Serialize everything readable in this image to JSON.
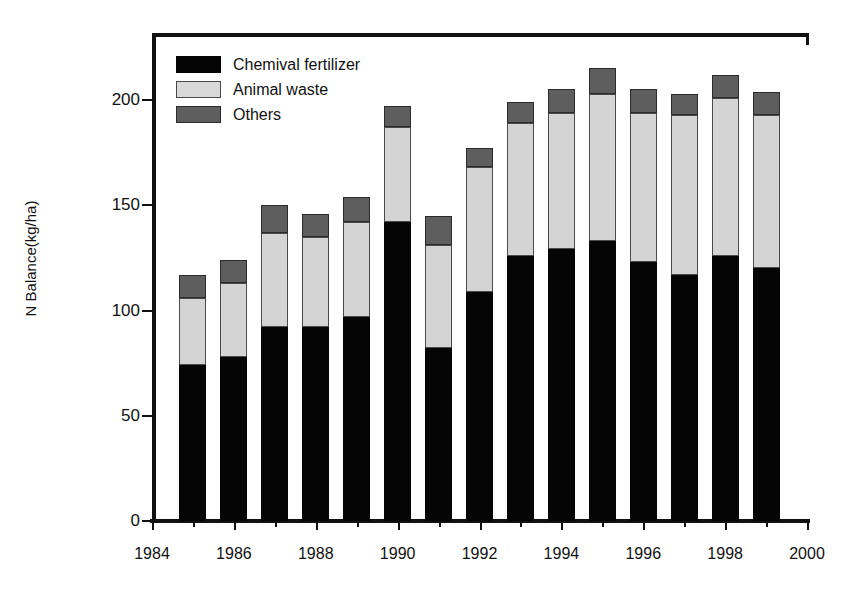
{
  "chart_data": {
    "type": "bar",
    "stacked": true,
    "title": "",
    "xlabel": "",
    "ylabel": "N Balance(kg/ha)",
    "xlim": [
      1984,
      2000
    ],
    "ylim": [
      0,
      215
    ],
    "yticks": [
      0,
      50,
      100,
      150,
      200
    ],
    "ytick_labels": [
      "0",
      "50",
      "100",
      "150",
      "200"
    ],
    "xticks": [
      1984,
      1986,
      1988,
      1990,
      1992,
      1994,
      1996,
      1998,
      2000
    ],
    "xtick_labels": [
      "1984",
      "1986",
      "1988",
      "1990",
      "1992",
      "1994",
      "1996",
      "1998",
      "2000"
    ],
    "xminor_ticks": [
      1985,
      1987,
      1989,
      1991,
      1993,
      1995,
      1997,
      1999
    ],
    "grid": false,
    "legend_position": "upper-left",
    "categories": [
      1985,
      1986,
      1987,
      1988,
      1989,
      1990,
      1991,
      1992,
      1993,
      1994,
      1995,
      1996,
      1997,
      1998,
      1999
    ],
    "series": [
      {
        "name": "Chemival fertilizer",
        "color": "#050505",
        "values": [
          74,
          78,
          92,
          92,
          97,
          142,
          82,
          109,
          126,
          129,
          133,
          123,
          117,
          126,
          120
        ]
      },
      {
        "name": "Animal waste",
        "color": "#d4d4d4",
        "values": [
          32,
          35,
          45,
          43,
          45,
          45,
          49,
          59,
          63,
          65,
          70,
          71,
          76,
          75,
          73
        ]
      },
      {
        "name": "Others",
        "color": "#5e5e5e",
        "values": [
          11,
          11,
          13,
          11,
          12,
          10,
          14,
          9,
          10,
          11,
          12,
          11,
          10,
          11,
          11
        ]
      }
    ],
    "totals": [
      117,
      124,
      150,
      146,
      154,
      197,
      145,
      177,
      199,
      205,
      215,
      205,
      203,
      212,
      204
    ]
  },
  "legend": {
    "items": [
      {
        "label": "Chemival fertilizer",
        "swatch": "fert"
      },
      {
        "label": "Animal waste",
        "swatch": "animal"
      },
      {
        "label": "Others",
        "swatch": "others"
      }
    ]
  }
}
